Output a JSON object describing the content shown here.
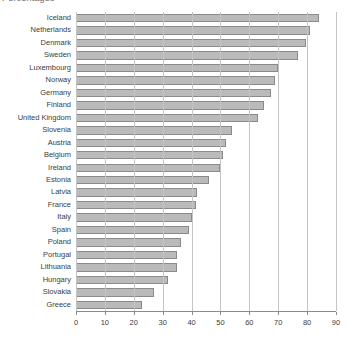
{
  "subtitle_partial": "Percentages",
  "chart_data": {
    "type": "bar",
    "orientation": "horizontal",
    "title": "",
    "xlabel": "",
    "ylabel": "",
    "xlim": [
      0,
      90
    ],
    "xticks": [
      0,
      10,
      20,
      30,
      40,
      50,
      60,
      70,
      80,
      90
    ],
    "grid": "vertical",
    "legend": "none",
    "categories": [
      "Iceland",
      "Netherlands",
      "Denmark",
      "Sweden",
      "Luxembourg",
      "Norway",
      "Germany",
      "Finland",
      "United Kingdom",
      "Slovenia",
      "Austria",
      "Belgium",
      "Ireland",
      "Estonia",
      "Latvia",
      "France",
      "Italy",
      "Spain",
      "Poland",
      "Portugal",
      "Lithuania",
      "Hungary",
      "Slovakia",
      "Greece"
    ],
    "values": [
      84,
      81,
      79.5,
      77,
      70,
      69,
      67.5,
      65,
      63,
      54,
      52,
      51,
      50,
      46,
      42,
      41.5,
      40,
      39,
      36.5,
      35,
      35,
      32,
      27,
      23
    ],
    "colors": {
      "bar_fill": "#bababa",
      "bar_border": "#8a8a8a",
      "gridline": "#c4c4c4",
      "axis": "#8a8a8a",
      "label_text": "#3c3c3c"
    }
  }
}
